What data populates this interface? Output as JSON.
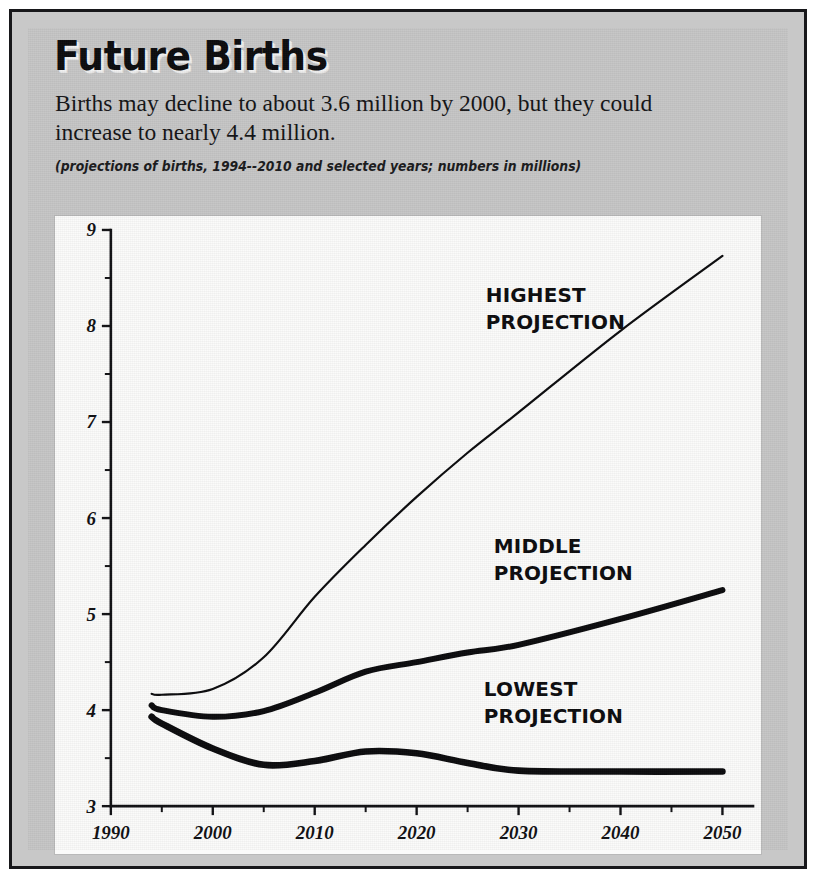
{
  "figure": {
    "title": "Future Births",
    "deck": "Births may decline to about 3.6 million by 2000, but they could increase to nearly 4.4 million.",
    "caption": "(projections of births, 1994--2010 and selected years; numbers in millions)"
  },
  "colors": {
    "panel_background": "#c6c6c6",
    "plot_background": "#fbfbfa",
    "ink": "#0b0b0d",
    "frame": "#17171a"
  },
  "chart_data": {
    "type": "line",
    "title": "Future Births",
    "subtitle": "Births may decline to about 3.6 million by 2000, but they could increase to nearly 4.4 million.",
    "annotation": "(projections of births, 1994--2010 and selected years; numbers in millions)",
    "xlabel": "",
    "ylabel": "",
    "xlim": [
      1990,
      2053
    ],
    "ylim": [
      3,
      9
    ],
    "grid": false,
    "legend_position": "inline-annotations",
    "x_ticks": [
      1990,
      2000,
      2010,
      2020,
      2030,
      2040,
      2050
    ],
    "x_minor_ticks": [
      1995,
      2005,
      2015,
      2025,
      2035,
      2045
    ],
    "y_ticks": [
      3,
      4,
      5,
      6,
      7,
      8,
      9
    ],
    "y_minor_ticks": [
      3.5,
      4.5,
      5.5,
      6.5,
      7.5,
      8.5
    ],
    "x": [
      1994,
      1995,
      2000,
      2005,
      2010,
      2015,
      2020,
      2025,
      2030,
      2040,
      2050
    ],
    "series": [
      {
        "name": "HIGHEST PROJECTION",
        "label": "HIGHEST",
        "label_line2": "PROJECTION",
        "stroke_width": 2.2,
        "values": [
          4.17,
          4.16,
          4.22,
          4.55,
          5.18,
          5.72,
          6.22,
          6.68,
          7.1,
          7.95,
          8.73
        ]
      },
      {
        "name": "MIDDLE PROJECTION",
        "label": "MIDDLE",
        "label_line2": "PROJECTION",
        "stroke_width": 6.0,
        "values": [
          4.05,
          4.0,
          3.93,
          3.99,
          4.18,
          4.4,
          4.5,
          4.6,
          4.68,
          4.95,
          5.25
        ]
      },
      {
        "name": "LOWEST PROJECTION",
        "label": "LOWEST",
        "label_line2": "PROJECTION",
        "stroke_width": 6.6,
        "values": [
          3.93,
          3.86,
          3.6,
          3.43,
          3.47,
          3.57,
          3.55,
          3.45,
          3.37,
          3.36,
          3.36
        ]
      }
    ]
  }
}
